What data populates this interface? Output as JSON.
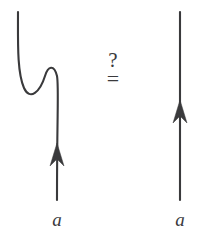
{
  "figure": {
    "background_color": "#ffffff",
    "ink_color": "#3a3a3c",
    "width": 202,
    "height": 243
  },
  "relation": {
    "question_mark": "?",
    "equals_sign": "=",
    "combined": "?="
  },
  "left_diagram": {
    "name": "kinked-strand",
    "label": "a",
    "arrow_direction": "upward",
    "description": "strand with a kink / curl",
    "strand_path": "M 18 12 C 18 42, 17 72, 24 88 C 30 101, 40 92, 45 76 C 48 66, 54 64, 57 76 C 59 86, 57 110, 57 200",
    "arrow_tip": {
      "x": 57,
      "y": 143
    },
    "arrow_polygon": "57,143 64,166 57,159 50,166"
  },
  "right_diagram": {
    "name": "straight-strand",
    "label": "a",
    "arrow_direction": "upward",
    "description": "plain vertical strand",
    "strand_path": "M 180 12 L 180 200",
    "arrow_tip": {
      "x": 180,
      "y": 100
    },
    "arrow_polygon": "180,100 187,123 180,116 173,123"
  }
}
